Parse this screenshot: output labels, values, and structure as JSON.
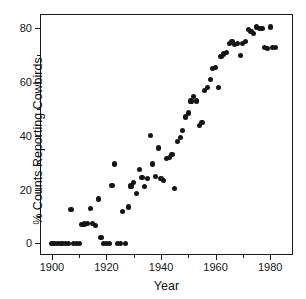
{
  "chart_data": {
    "type": "scatter",
    "title": "",
    "xlabel": "Year",
    "ylabel": "% Counts Reporting Cowbirds",
    "xlim": [
      1896,
      1988
    ],
    "ylim": [
      -4,
      85
    ],
    "grid": false,
    "legend": null,
    "marker_color": "#151515",
    "xticks_major": [
      1900,
      1920,
      1940,
      1960,
      1980
    ],
    "xticklabels": [
      "1900",
      "1920",
      "1940",
      "1960",
      "1980"
    ],
    "xticks_minor": [
      1910,
      1930,
      1950,
      1970
    ],
    "yticks_major": [
      0,
      20,
      40,
      60,
      80
    ],
    "yticklabels": [
      "0",
      "20",
      "40",
      "60",
      "80"
    ],
    "yticks_minor": [
      10,
      30,
      50,
      70
    ],
    "x": [
      1900,
      1901,
      1902,
      1903,
      1904,
      1905,
      1906,
      1907,
      1908,
      1909,
      1910,
      1911,
      1912,
      1913,
      1914,
      1915,
      1916,
      1917,
      1918,
      1919,
      1920,
      1921,
      1922,
      1923,
      1924,
      1925,
      1926,
      1927,
      1928,
      1929,
      1930,
      1931,
      1932,
      1933,
      1934,
      1935,
      1936,
      1937,
      1938,
      1939,
      1940,
      1941,
      1942,
      1943,
      1944,
      1945,
      1946,
      1947,
      1948,
      1949,
      1950,
      1951,
      1952,
      1953,
      1954,
      1955,
      1956,
      1957,
      1958,
      1959,
      1960,
      1961,
      1962,
      1963,
      1964,
      1965,
      1966,
      1967,
      1968,
      1969,
      1970,
      1971,
      1972,
      1973,
      1974,
      1975,
      1976,
      1977,
      1978,
      1979,
      1980,
      1981,
      1982
    ],
    "y": [
      0,
      0,
      0,
      0,
      0,
      0,
      0,
      12.5,
      0,
      0,
      0,
      7.0,
      7.2,
      7.5,
      12.8,
      7.5,
      6.5,
      16.5,
      2.0,
      0,
      0,
      0,
      21.5,
      29.5,
      0,
      0,
      11.8,
      0,
      13.5,
      21.3,
      22.5,
      18.5,
      27.5,
      24.5,
      21.0,
      24.0,
      40.0,
      29.5,
      25.0,
      35.5,
      24.0,
      23.5,
      31.5,
      32.0,
      33.0,
      20.5,
      38.0,
      39.5,
      42.0,
      47.0,
      48.5,
      53.0,
      54.5,
      53.0,
      44.0,
      45.0,
      57.0,
      58.0,
      61.0,
      65.0,
      65.5,
      58.0,
      69.5,
      70.5,
      71.0,
      74.5,
      75.0,
      74.0,
      74.5,
      70.0,
      74.5,
      75.0,
      79.5,
      79.0,
      78.0,
      80.5,
      80.0,
      80.0,
      73.0,
      72.5,
      80.5,
      72.8,
      73.0
    ]
  },
  "axis": {
    "xlabel": "Year",
    "ylabel": "% Counts Reporting Cowbirds"
  }
}
